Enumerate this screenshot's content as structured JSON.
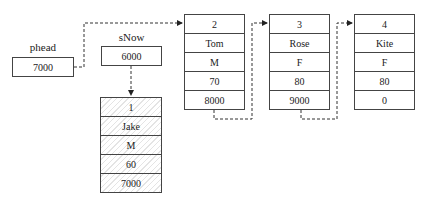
{
  "pointers": {
    "phead": {
      "label": "phead",
      "value": "7000"
    },
    "sNow": {
      "label": "sNow",
      "value": "6000"
    }
  },
  "nodes": [
    {
      "id": "jake",
      "fields": [
        "1",
        "Jake",
        "M",
        "60",
        "7000"
      ],
      "highlighted": true
    },
    {
      "id": "tom",
      "fields": [
        "2",
        "Tom",
        "M",
        "70",
        "8000"
      ],
      "highlighted": false
    },
    {
      "id": "rose",
      "fields": [
        "3",
        "Rose",
        "F",
        "80",
        "9000"
      ],
      "highlighted": false
    },
    {
      "id": "kite",
      "fields": [
        "4",
        "Kite",
        "F",
        "80",
        "0"
      ],
      "highlighted": false
    }
  ],
  "caption": ""
}
